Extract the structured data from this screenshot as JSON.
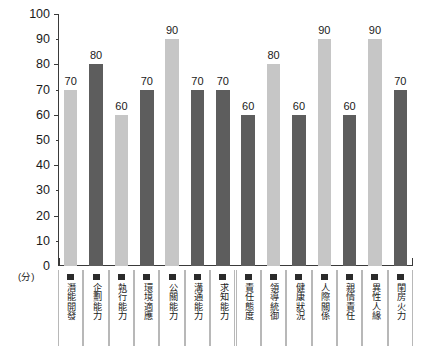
{
  "chart_data": {
    "type": "bar",
    "title": "",
    "xlabel": "",
    "ylabel": "(分)",
    "ylim": [
      0,
      100
    ],
    "ytick_step": 10,
    "grid": false,
    "legend": "none",
    "categories": [
      "潛能開發",
      "企劃能力",
      "執行能力",
      "環境適應",
      "公關能力",
      "溝通能力",
      "求知能力",
      "責任態度",
      "領導統御",
      "健康狀況",
      "人際關係",
      "親情責任",
      "異性人緣",
      "閨房火力"
    ],
    "values": [
      70,
      80,
      60,
      70,
      90,
      70,
      70,
      60,
      80,
      60,
      90,
      60,
      90,
      70
    ],
    "bar_colors": [
      "#c6c6c6",
      "#5d5d5d",
      "#c6c6c6",
      "#5d5d5d",
      "#c6c6c6",
      "#5d5d5d",
      "#5d5d5d",
      "#5d5d5d",
      "#c6c6c6",
      "#5d5d5d",
      "#c6c6c6",
      "#5d5d5d",
      "#c6c6c6",
      "#5d5d5d"
    ],
    "ytick_labels": [
      "100",
      "90",
      "80",
      "70",
      "60",
      "50",
      "40",
      "30",
      "20",
      "10",
      "0"
    ],
    "ytick_values": [
      100,
      90,
      80,
      70,
      60,
      50,
      40,
      30,
      20,
      10,
      0
    ],
    "data_labels": [
      "70",
      "80",
      "60",
      "70",
      "90",
      "70",
      "70",
      "60",
      "80",
      "60",
      "90",
      "60",
      "90",
      "70"
    ]
  },
  "axis": {
    "unit_label": "(分)",
    "axis_color": "#3a3a3a"
  },
  "labels": {
    "marker_color": "#2b2b2b",
    "separator_color": "#b8b8b8"
  }
}
